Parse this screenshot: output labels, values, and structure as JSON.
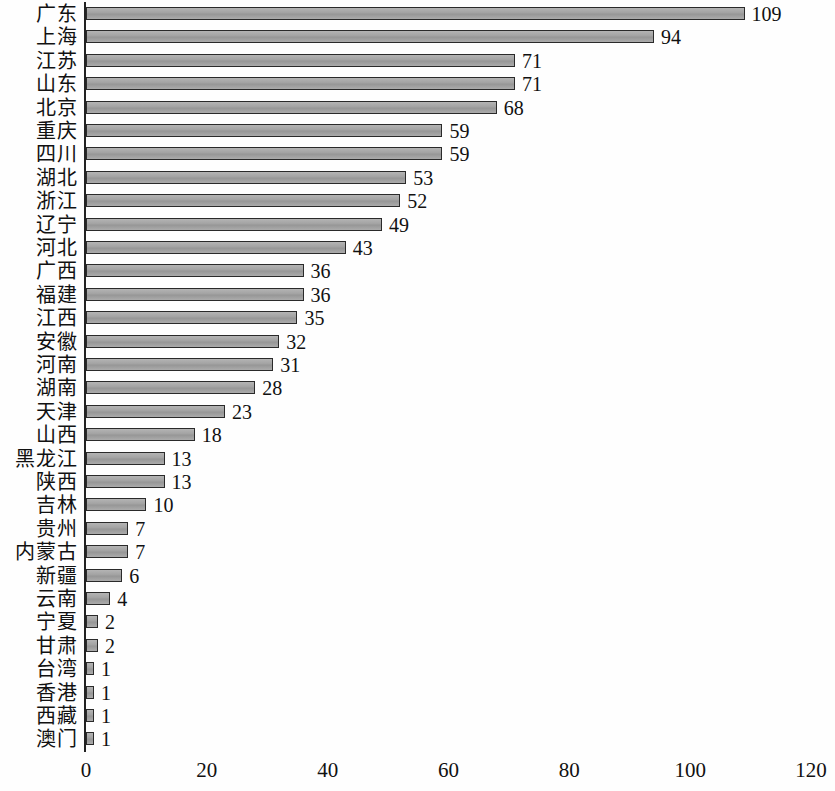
{
  "chart_data": {
    "type": "bar",
    "orientation": "horizontal",
    "title": "",
    "subtitle": "",
    "xlabel": "",
    "ylabel": "",
    "xlim": [
      0,
      120
    ],
    "x_ticks": [
      0,
      20,
      40,
      60,
      80,
      100,
      120
    ],
    "x_tick_labels": [
      "0",
      "20",
      "40",
      "60",
      "80",
      "100",
      "120"
    ],
    "grid": false,
    "legend": null,
    "bar_color": "#a2a2a2",
    "bar_border_color": "#2a2a2a",
    "axis_color": "#222222",
    "background_color": "#ffffff",
    "show_value_labels": true,
    "categories": [
      "广东",
      "上海",
      "江苏",
      "山东",
      "北京",
      "重庆",
      "四川",
      "湖北",
      "浙江",
      "辽宁",
      "河北",
      "广西",
      "福建",
      "江西",
      "安徽",
      "河南",
      "湖南",
      "天津",
      "山西",
      "黑龙江",
      "陕西",
      "吉林",
      "贵州",
      "内蒙古",
      "新疆",
      "云南",
      "宁夏",
      "甘肃",
      "台湾",
      "香港",
      "西藏",
      "澳门"
    ],
    "values": [
      109,
      94,
      71,
      71,
      68,
      59,
      59,
      53,
      52,
      49,
      43,
      36,
      36,
      35,
      32,
      31,
      28,
      23,
      18,
      13,
      13,
      10,
      7,
      7,
      6,
      4,
      2,
      2,
      1,
      1,
      1,
      1
    ],
    "value_labels": [
      "109",
      "94",
      "71",
      "71",
      "68",
      "59",
      "59",
      "53",
      "52",
      "49",
      "43",
      "36",
      "36",
      "35",
      "32",
      "31",
      "28",
      "23",
      "18",
      "13",
      "13",
      "10",
      "7",
      "7",
      "6",
      "4",
      "2",
      "2",
      "1",
      "1",
      "1",
      "1"
    ]
  }
}
